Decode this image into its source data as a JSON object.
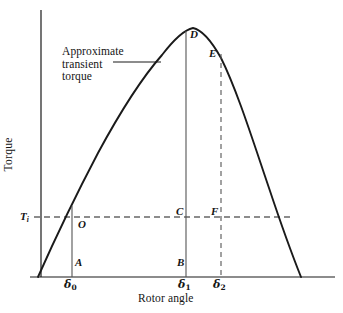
{
  "figure": {
    "kind": "line-diagram",
    "background_color": "#ffffff",
    "ink_color": "#1a1a1a"
  },
  "axes": {
    "y_label": "Torque",
    "x_label": "Rotor angle",
    "y_axis_origin_px": {
      "x": 41,
      "y": 277
    },
    "y_axis_top_px": {
      "x": 41,
      "y": 10
    },
    "x_axis_start_px": {
      "x": 30,
      "y": 277
    },
    "x_axis_end_px": {
      "x": 335,
      "y": 277
    }
  },
  "annotation": {
    "line1": "Approximate",
    "line2": "transient",
    "line3": "torque",
    "leader_from_px": {
      "x": 113,
      "y": 62
    },
    "leader_to_px": {
      "x": 161,
      "y": 62
    }
  },
  "threshold": {
    "label_text": "T",
    "label_sub": "i",
    "level_y_px": 217,
    "dash_start_px": 34,
    "dash_end_px": 291
  },
  "points": [
    {
      "id": "O",
      "label": "O",
      "x_px": 78,
      "y_px": 224,
      "note": "intersection of rising curve and Ti line"
    },
    {
      "id": "A",
      "label": "A",
      "x_px": 75,
      "y_px": 263,
      "note": "foot of delta-0 ordinate"
    },
    {
      "id": "B",
      "label": "B",
      "x_px": 177,
      "y_px": 263,
      "note": "foot of delta-1 ordinate"
    },
    {
      "id": "C",
      "label": "C",
      "x_px": 180,
      "y_px": 212,
      "note": "delta-1 ordinate crossing Ti line"
    },
    {
      "id": "D",
      "label": "D",
      "x_px": 197,
      "y_px": 35,
      "note": "top of delta-1 ordinate at curve peak"
    },
    {
      "id": "E",
      "label": "E",
      "x_px": 209,
      "y_px": 54,
      "note": "top of delta-2 ordinate on curve"
    },
    {
      "id": "F",
      "label": "F",
      "x_px": 214,
      "y_px": 212,
      "note": "delta-2 ordinate crossing Ti line"
    }
  ],
  "x_ticks": [
    {
      "symbol": "δ",
      "sub": "0",
      "x_px": 66,
      "y_px": 281
    },
    {
      "symbol": "δ",
      "sub": "1",
      "x_px": 180,
      "y_px": 281
    },
    {
      "symbol": "δ",
      "sub": "2",
      "x_px": 215,
      "y_px": 281
    }
  ],
  "chart_data": {
    "type": "line",
    "title": "",
    "xlabel": "Rotor angle",
    "ylabel": "Torque",
    "grid": false,
    "legend": null,
    "series": [
      {
        "name": "Approximate transient torque",
        "style": "solid",
        "comment": "sine-like power-angle curve rising from the origin region, peaking near delta-1 and falling to zero",
        "points_px": [
          [
            38,
            277
          ],
          [
            50,
            249
          ],
          [
            62,
            223
          ],
          [
            74,
            198
          ],
          [
            86,
            175
          ],
          [
            98,
            153
          ],
          [
            110,
            133
          ],
          [
            122,
            114
          ],
          [
            134,
            97
          ],
          [
            146,
            79
          ],
          [
            158,
            62
          ],
          [
            170,
            47
          ],
          [
            182,
            34
          ],
          [
            193,
            28
          ],
          [
            205,
            35
          ],
          [
            217,
            52
          ],
          [
            229,
            76
          ],
          [
            241,
            107
          ],
          [
            253,
            141
          ],
          [
            265,
            177
          ],
          [
            277,
            212
          ],
          [
            289,
            245
          ],
          [
            301,
            277
          ]
        ]
      }
    ],
    "reference_lines": [
      {
        "name": "input-torque-level",
        "orientation": "horizontal",
        "style": "dashed",
        "y_px": 217,
        "x_from_px": 34,
        "x_to_px": 291,
        "label": "T_i"
      },
      {
        "name": "delta0-ordinate",
        "orientation": "vertical",
        "style": "solid",
        "x_px": 72,
        "y_from_px": 206,
        "y_to_px": 277
      },
      {
        "name": "delta1-ordinate",
        "orientation": "vertical",
        "style": "solid",
        "x_px": 186,
        "y_from_px": 31,
        "y_to_px": 277
      },
      {
        "name": "delta2-ordinate",
        "orientation": "vertical",
        "style": "dashed",
        "x_px": 221,
        "y_from_px": 54,
        "y_to_px": 277
      }
    ]
  }
}
